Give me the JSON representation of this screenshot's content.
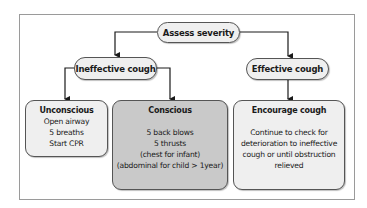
{
  "diagram": {
    "root": {
      "label": "Assess severity"
    },
    "branches": [
      {
        "label": "Ineffective cough",
        "children": [
          {
            "title": "Unconscious",
            "lines": [
              "Open airway",
              "5 breaths",
              "Start CPR"
            ]
          },
          {
            "title": "Conscious",
            "lines": [
              "",
              "5 back blows",
              "5 thrusts",
              "(chest for infant)",
              "(abdominal for child > 1year)"
            ]
          }
        ]
      },
      {
        "label": "Effective cough",
        "children": [
          {
            "title": "Encourage cough",
            "lines": [
              "",
              "Continue to check for",
              "deterioration to ineffective",
              "cough or until obstruction",
              "relieved"
            ]
          }
        ]
      }
    ]
  },
  "colors": {
    "node_fill": "#efefef",
    "highlight_fill": "#c9c9c9",
    "stroke": "#1a1a1a",
    "frame": "#9a9a9a"
  }
}
